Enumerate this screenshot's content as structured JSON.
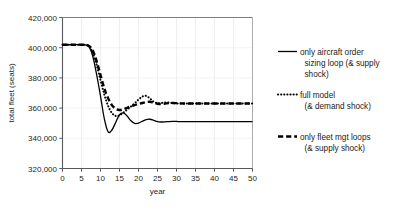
{
  "chart_data": {
    "type": "line",
    "title": "",
    "xlabel": "year",
    "ylabel": "total fleet (seats)",
    "xlim": [
      0,
      50
    ],
    "ylim": [
      320000,
      420000
    ],
    "ytick_step": 20000,
    "xtick_step": 5,
    "grid": true,
    "legend_position": "right",
    "xticks": [
      "0",
      "5",
      "10",
      "15",
      "20",
      "25",
      "30",
      "35",
      "40",
      "45",
      "50"
    ],
    "yticks": [
      "320,000",
      "340,000",
      "360,000",
      "380,000",
      "400,000",
      "420,000"
    ],
    "x": [
      0,
      1,
      2,
      3,
      4,
      5,
      6,
      7,
      8,
      9,
      10,
      11,
      12,
      13,
      14,
      15,
      16,
      17,
      18,
      19,
      20,
      21,
      22,
      23,
      24,
      25,
      26,
      27,
      28,
      29,
      30,
      31,
      32,
      33,
      34,
      35,
      36,
      37,
      38,
      39,
      40,
      41,
      42,
      43,
      44,
      45,
      46,
      47,
      48,
      49,
      50
    ],
    "series": [
      {
        "name": "only aircraft order sizing loop (& supply shock)",
        "style": "solid",
        "color": "#000000",
        "values": [
          402000,
          402000,
          402000,
          402000,
          402000,
          402000,
          401800,
          400500,
          394000,
          382000,
          368000,
          353000,
          344300,
          345500,
          350500,
          355600,
          356800,
          354800,
          351600,
          349900,
          350000,
          351300,
          352400,
          352600,
          351900,
          351100,
          350800,
          350900,
          351100,
          351200,
          351150,
          351050,
          351000,
          351000,
          351000,
          351000,
          351000,
          351000,
          351000,
          351000,
          351000,
          351000,
          351000,
          351000,
          351000,
          351000,
          351000,
          351000,
          351000,
          351000,
          351000
        ]
      },
      {
        "name": "full model (& demand shock)",
        "style": "dotted",
        "color": "#000000",
        "values": [
          402000,
          402000,
          402000,
          402000,
          402000,
          402000,
          401800,
          400800,
          396500,
          388500,
          378500,
          369000,
          361500,
          356800,
          354800,
          355200,
          357000,
          359000,
          361000,
          363200,
          365600,
          367600,
          368100,
          366400,
          364200,
          363300,
          363400,
          363700,
          363600,
          363300,
          363100,
          363000,
          363000,
          363000,
          363000,
          363000,
          363000,
          363000,
          363000,
          363000,
          363000,
          363000,
          363000,
          363000,
          363000,
          363000,
          363000,
          363000,
          363000,
          363000,
          363000
        ]
      },
      {
        "name": "only fleet mgt loops (& supply shock)",
        "style": "dashed",
        "color": "#000000",
        "values": [
          402000,
          402000,
          402000,
          402000,
          402000,
          402000,
          401900,
          401200,
          398000,
          391000,
          382000,
          373000,
          366500,
          362000,
          359500,
          358700,
          359200,
          360200,
          361200,
          362000,
          362700,
          363400,
          364000,
          364200,
          363600,
          362900,
          362700,
          363000,
          363300,
          363400,
          363300,
          363150,
          363050,
          363000,
          363000,
          363000,
          363000,
          363000,
          363000,
          363000,
          363000,
          363000,
          363000,
          363000,
          363000,
          363000,
          363000,
          363000,
          363000,
          363000,
          363000
        ]
      }
    ],
    "legend": [
      {
        "style": "solid",
        "lines": [
          "only aircraft order",
          "sizing loop (& supply",
          "shock)"
        ]
      },
      {
        "style": "dotted",
        "lines": [
          "full model",
          "(& demand shock)"
        ]
      },
      {
        "style": "dashed",
        "lines": [
          "only fleet mgt loops",
          "(& supply shock)"
        ]
      }
    ]
  }
}
